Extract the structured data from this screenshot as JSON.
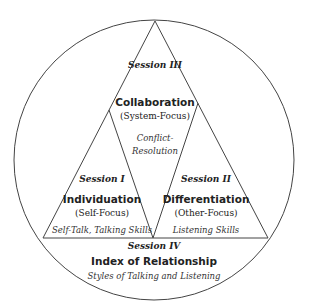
{
  "diagram": {
    "sessions": [
      {
        "id": "III",
        "session": "Session III",
        "title": "Collaboration",
        "focus": "(System-Focus)",
        "skills_line1": "Conflict-",
        "skills_line2": "Resolution"
      },
      {
        "id": "I",
        "session": "Session I",
        "title": "Individuation",
        "focus": "(Self-Focus)",
        "skills": "Self-Talk, Talking Skills"
      },
      {
        "id": "II",
        "session": "Session II",
        "title": "Differentiation",
        "focus": "(Other-Focus)",
        "skills": "Listening Skills"
      },
      {
        "id": "IV",
        "session": "Session IV",
        "title": "Index of Relationship",
        "skills": "Styles of Talking and Listening"
      }
    ],
    "colors": {
      "stroke": "#444444",
      "text": "#222222",
      "background": "#ffffff"
    }
  }
}
